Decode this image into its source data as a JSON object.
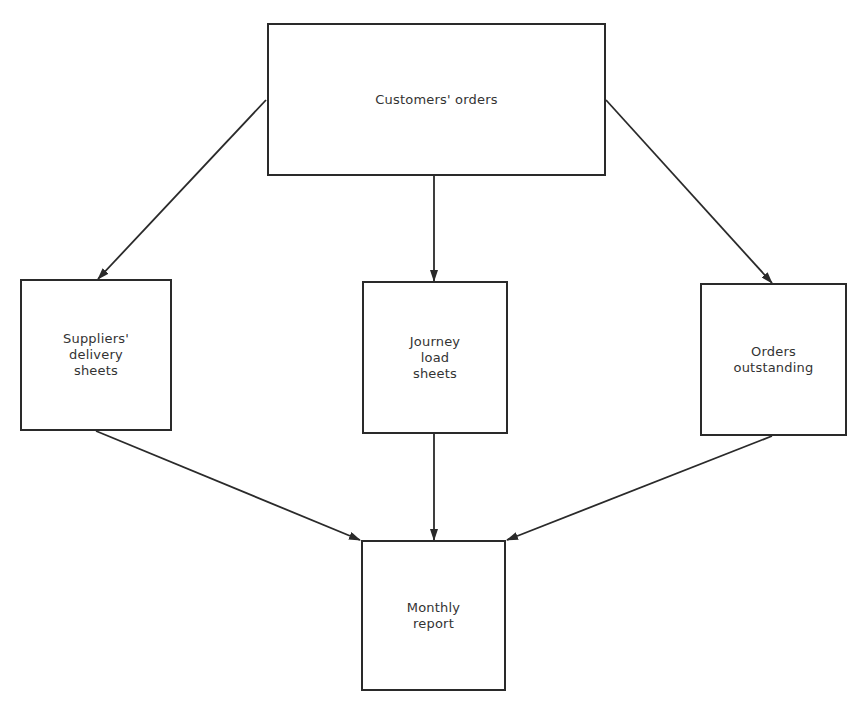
{
  "diagram": {
    "type": "flow-diagram",
    "nodes": [
      {
        "id": "customers_orders",
        "label": "Customers' orders",
        "x": 267,
        "y": 23,
        "w": 339,
        "h": 153
      },
      {
        "id": "suppliers_delivery_sheets",
        "label": "Suppliers'\ndelivery\nsheets",
        "x": 20,
        "y": 279,
        "w": 152,
        "h": 152
      },
      {
        "id": "journey_load_sheets",
        "label": "Journey\nload\nsheets",
        "x": 362,
        "y": 281,
        "w": 146,
        "h": 153
      },
      {
        "id": "orders_outstanding",
        "label": "Orders\noutstanding",
        "x": 700,
        "y": 283,
        "w": 147,
        "h": 153
      },
      {
        "id": "monthly_report",
        "label": "Monthly\nreport",
        "x": 361,
        "y": 540,
        "w": 145,
        "h": 151
      }
    ],
    "edges": [
      {
        "from": "customers_orders",
        "to": "suppliers_delivery_sheets",
        "x1": 266,
        "y1": 100,
        "x2": 98,
        "y2": 279
      },
      {
        "from": "customers_orders",
        "to": "journey_load_sheets",
        "x1": 434,
        "y1": 176,
        "x2": 434,
        "y2": 281
      },
      {
        "from": "customers_orders",
        "to": "orders_outstanding",
        "x1": 606,
        "y1": 100,
        "x2": 772,
        "y2": 283
      },
      {
        "from": "suppliers_delivery_sheets",
        "to": "monthly_report",
        "x1": 96,
        "y1": 431,
        "x2": 360,
        "y2": 540
      },
      {
        "from": "journey_load_sheets",
        "to": "monthly_report",
        "x1": 434,
        "y1": 434,
        "x2": 434,
        "y2": 540
      },
      {
        "from": "orders_outstanding",
        "to": "monthly_report",
        "x1": 772,
        "y1": 436,
        "x2": 507,
        "y2": 540
      }
    ],
    "colors": {
      "line": "#2a2a2a",
      "text": "#333333",
      "background": "#ffffff"
    }
  }
}
